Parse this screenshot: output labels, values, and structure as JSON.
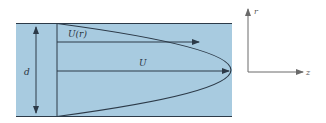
{
  "figure": {
    "type": "velocity-profile-diagram",
    "colors": {
      "fluid_fill": "#a8cbe0",
      "line": "#2c3a48",
      "axis_line": "#6a6a6a",
      "background": "#ffffff"
    },
    "labels": {
      "velocity_profile": "U(r)",
      "max_velocity": "U",
      "width": "d",
      "axis_r": "r",
      "axis_z": "z"
    }
  }
}
